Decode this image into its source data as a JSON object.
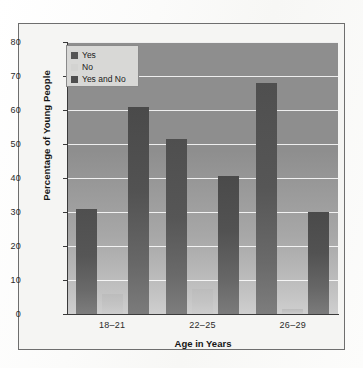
{
  "chart_data": {
    "type": "bar",
    "title": "",
    "subtitle": "",
    "xlabel": "Age in Years",
    "ylabel": "Percentage of Young People",
    "categories": [
      "18–21",
      "22–25",
      "26–29"
    ],
    "series": [
      {
        "name": "Yes",
        "color": "#565656",
        "values": [
          31,
          51.5,
          68
        ]
      },
      {
        "name": "No",
        "color": "#c6c6c4",
        "values": [
          6,
          7.5,
          1.5
        ]
      },
      {
        "name": "Yes and No",
        "color": "#4e4e4e",
        "values": [
          61,
          40.5,
          30
        ]
      }
    ],
    "ylim": [
      0,
      80
    ],
    "yticks": [
      0,
      10,
      20,
      30,
      40,
      50,
      60,
      70,
      80
    ],
    "ytick_labels": [
      "0",
      "10",
      "20",
      "30",
      "40",
      "50",
      "60",
      "70",
      "80"
    ],
    "grid": "horizontal",
    "legend_position": "top-left",
    "legend_entries": [
      "Yes",
      "No",
      "Yes and No"
    ]
  },
  "legend": {
    "items": [
      {
        "label": "Yes"
      },
      {
        "label": "No"
      },
      {
        "label": "Yes and No"
      }
    ]
  },
  "axes": {
    "y_title": "Percentage of Young People",
    "x_title": "Age in Years"
  }
}
